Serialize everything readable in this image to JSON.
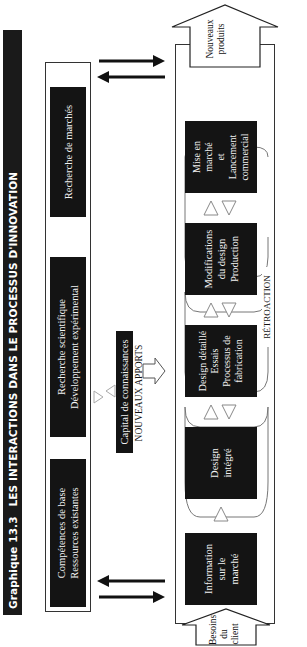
{
  "title": {
    "number": "Graphique 13.3",
    "text": "LES INTERACTIONS DANS LE PROCESSUS D'INNOVATION"
  },
  "resources_group": {
    "boxes": [
      {
        "lines": [
          "Compétences de base",
          "Ressources existantes"
        ]
      },
      {
        "lines": [
          "Recherche scientifique",
          "Développement expérimental"
        ]
      },
      {
        "lines": [
          "Recherche de marchés"
        ]
      }
    ]
  },
  "knowledge": {
    "box": "Capital de connaissances",
    "label": "NOUVEAUX APPORTS"
  },
  "process": {
    "input_arrow": [
      "Besoins",
      "du",
      "client"
    ],
    "output_arrow": [
      "Nouveaux",
      "produits"
    ],
    "steps": [
      {
        "lines": [
          "Information",
          "sur le",
          "marché"
        ]
      },
      {
        "lines": [
          "Design",
          "intégré"
        ]
      },
      {
        "lines": [
          "Design détaillé",
          "Essais",
          "Processus de",
          "fabrication"
        ]
      },
      {
        "lines": [
          "Modifications",
          "du design",
          "Production"
        ]
      },
      {
        "lines": [
          "Mise en",
          "marché",
          "et",
          "Lancement",
          "commercial"
        ]
      }
    ],
    "feedback_label": "RÉTROACTION"
  },
  "colors": {
    "box_fill": "#141414",
    "box_text": "#f2f2f2",
    "outline": "#333333",
    "background": "#ffffff"
  }
}
